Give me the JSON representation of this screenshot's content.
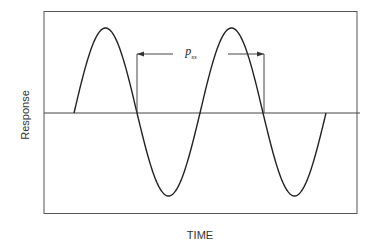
{
  "chart_data": {
    "type": "line",
    "title": "",
    "xlabel": "TIME",
    "ylabel": "Response",
    "grid": false,
    "legend": null,
    "axis_ticks": false,
    "series": [
      {
        "name": "response",
        "shape": "sine",
        "cycles": 2,
        "x_start_px": 74,
        "x_end_px": 326,
        "points_px": [
          [
            74,
            113
          ],
          [
            105,
            29
          ],
          [
            137,
            113
          ],
          [
            169,
            196
          ],
          [
            200,
            113
          ],
          [
            232,
            28
          ],
          [
            264,
            113
          ],
          [
            295,
            196
          ],
          [
            326,
            113
          ]
        ]
      }
    ],
    "zero_line": {
      "y_px": 113
    },
    "annotations": [
      {
        "label_base": "p",
        "label_sub": "ss",
        "type": "period-dimension",
        "from_x_px": 137,
        "to_x_px": 264,
        "y_px": 54
      }
    ],
    "frame_px": {
      "left": 44,
      "top": 11,
      "right": 357,
      "bottom": 213
    }
  }
}
